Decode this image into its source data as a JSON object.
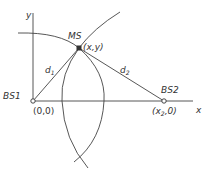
{
  "diagram": {
    "type": "trilateration-geometry",
    "colors": {
      "line": "#444444",
      "text": "#333333",
      "background": "#ffffff"
    },
    "axes": {
      "x_label": "x",
      "y_label": "y"
    },
    "nodes": {
      "bs1": {
        "name": "BS1",
        "coord": "(0,0)"
      },
      "bs2": {
        "name": "BS2",
        "coord_prefix": "(x",
        "coord_sub": "2",
        "coord_suffix": ",0)"
      },
      "ms": {
        "name": "MS",
        "coord": "(x,y)"
      }
    },
    "edges": {
      "d1": {
        "label": "d",
        "sub": "1"
      },
      "d2": {
        "label": "d",
        "sub": "2"
      }
    }
  }
}
